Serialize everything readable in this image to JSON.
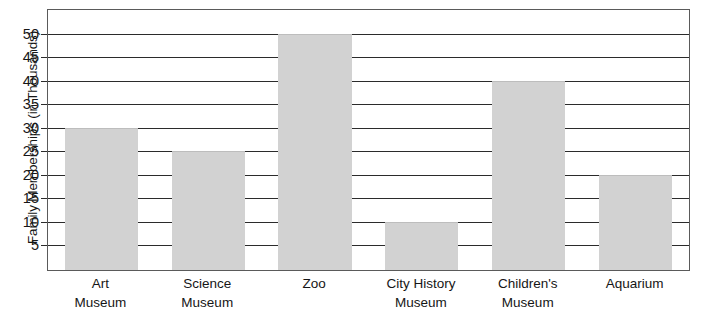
{
  "chart_data": {
    "type": "bar",
    "title": "",
    "xlabel": "",
    "ylabel": "Family Memberships (in Thousands)",
    "categories": [
      "Art Museum",
      "Science Museum",
      "Zoo",
      "City History Museum",
      "Children's Museum",
      "Aquarium"
    ],
    "category_lines": [
      [
        "Art",
        "Museum"
      ],
      [
        "Science",
        "Museum"
      ],
      [
        "Zoo",
        ""
      ],
      [
        "City History",
        "Museum"
      ],
      [
        "Children's",
        "Museum"
      ],
      [
        "Aquarium",
        ""
      ]
    ],
    "values": [
      30,
      25,
      50,
      10,
      40,
      20
    ],
    "ylim": [
      0,
      55
    ],
    "yticks": [
      5,
      10,
      15,
      20,
      25,
      30,
      35,
      40,
      45,
      50
    ],
    "ytick_labels": [
      "5",
      "10",
      "15",
      "20",
      "25",
      "30",
      "35",
      "40",
      "45",
      "50"
    ],
    "grid": true,
    "legend": false,
    "bar_color": "#d2d2d2",
    "axis_color": "#2b2b2b",
    "frame_color": "#5a5a5a"
  }
}
